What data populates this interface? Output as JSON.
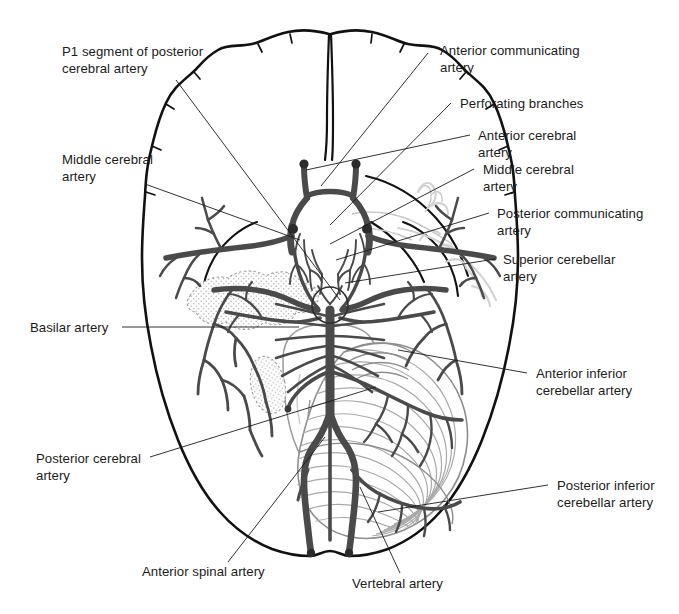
{
  "figure": {
    "background_color": "#ffffff",
    "ink_color": "#1b1b1b",
    "vessel_color": "#4a4a4a",
    "outline_color": "#111111",
    "faint_color": "#b8b8b8",
    "width": 679,
    "height": 614
  },
  "labels": [
    {
      "id": "p1-segment-of-posterior-cerebral-artery",
      "text": "P1 segment of posterior\ncerebral artery",
      "x": 62,
      "y": 44,
      "align": "left",
      "leader": [
        [
          176,
          80
        ],
        [
          340,
          300
        ]
      ]
    },
    {
      "id": "middle-cerebral-artery-left",
      "text": "Middle cerebral\nartery",
      "x": 62,
      "y": 152,
      "align": "left",
      "leader": [
        [
          145,
          184
        ],
        [
          300,
          240
        ]
      ]
    },
    {
      "id": "basilar-artery",
      "text": "Basilar artery",
      "x": 30,
      "y": 320,
      "align": "left",
      "leader": [
        [
          122,
          327
        ],
        [
          299,
          327
        ]
      ]
    },
    {
      "id": "posterior-cerebral-artery",
      "text": "Posterior cerebral\nartery",
      "x": 36,
      "y": 451,
      "align": "left",
      "leader": [
        [
          150,
          457
        ],
        [
          376,
          387
        ]
      ]
    },
    {
      "id": "anterior-spinal-artery",
      "text": "Anterior spinal artery",
      "x": 142,
      "y": 564,
      "align": "left",
      "leader": [
        [
          228,
          562
        ],
        [
          325,
          437
        ]
      ]
    },
    {
      "id": "vertebral-artery",
      "text": "Vertebral artery",
      "x": 352,
      "y": 576,
      "align": "left",
      "leader": [
        [
          400,
          573
        ],
        [
          360,
          487
        ]
      ]
    },
    {
      "id": "anterior-communicating-artery",
      "text": "Anterior communicating\nartery",
      "x": 440,
      "y": 43,
      "align": "left",
      "leader": [
        [
          428,
          53
        ],
        [
          321,
          186
        ]
      ]
    },
    {
      "id": "perforating-branches",
      "text": "Perforating branches",
      "x": 460,
      "y": 96,
      "align": "left",
      "leader": [
        [
          451,
          103
        ],
        [
          330,
          225
        ]
      ]
    },
    {
      "id": "anterior-cerebral-artery",
      "text": "Anterior cerebral\nartery",
      "x": 478,
      "y": 128,
      "align": "left",
      "leader": [
        [
          470,
          135
        ],
        [
          306,
          170
        ]
      ]
    },
    {
      "id": "middle-cerebral-artery-right",
      "text": "Middle cerebral\nartery",
      "x": 483,
      "y": 162,
      "align": "left",
      "leader": [
        [
          474,
          169
        ],
        [
          330,
          244
        ]
      ]
    },
    {
      "id": "posterior-communicating-artery",
      "text": "Posterior communicating\nartery",
      "x": 497,
      "y": 206,
      "align": "left",
      "leader": [
        [
          489,
          213
        ],
        [
          336,
          260
        ]
      ]
    },
    {
      "id": "superior-cerebellar-artery",
      "text": "Superior cerebellar\nartery",
      "x": 503,
      "y": 252,
      "align": "left",
      "leader": [
        [
          495,
          259
        ],
        [
          345,
          283
        ]
      ]
    },
    {
      "id": "anterior-inferior-cerebellar-artery",
      "text": "Anterior inferior\ncerebellar artery",
      "x": 536,
      "y": 366,
      "align": "left",
      "leader": [
        [
          527,
          373
        ],
        [
          398,
          350
        ]
      ]
    },
    {
      "id": "posterior-inferior-cerebellar-artery",
      "text": "Posterior inferior\ncerebellar artery",
      "x": 557,
      "y": 478,
      "align": "left",
      "leader": [
        [
          548,
          485
        ],
        [
          378,
          512
        ]
      ]
    }
  ]
}
